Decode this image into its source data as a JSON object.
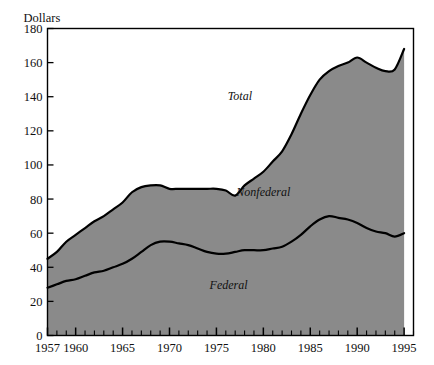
{
  "chart_data": {
    "type": "area",
    "title": "",
    "subtitle": "",
    "xlabel": "",
    "ylabel": "Dollars",
    "unit_label": "Dollars",
    "grid": false,
    "legend_position": "inline-annotations",
    "stacked": true,
    "xlim": [
      1957,
      1996
    ],
    "ylim": [
      0,
      180
    ],
    "ytick_labels": [
      "0",
      "20",
      "40",
      "60",
      "80",
      "100",
      "120",
      "140",
      "160",
      "180"
    ],
    "yticks": [
      0,
      20,
      40,
      60,
      80,
      100,
      120,
      140,
      160,
      180
    ],
    "xtick_labels": [
      "1957",
      "1960",
      "1965",
      "1970",
      "1975",
      "1980",
      "1985",
      "1990",
      "1995"
    ],
    "xticks": [
      1957,
      1960,
      1965,
      1970,
      1975,
      1980,
      1985,
      1990,
      1995
    ],
    "x": [
      1957,
      1958,
      1959,
      1960,
      1961,
      1962,
      1963,
      1964,
      1965,
      1966,
      1967,
      1968,
      1969,
      1970,
      1971,
      1972,
      1973,
      1974,
      1975,
      1976,
      1977,
      1978,
      1979,
      1980,
      1981,
      1982,
      1983,
      1984,
      1985,
      1986,
      1987,
      1988,
      1989,
      1990,
      1991,
      1992,
      1993,
      1994,
      1995
    ],
    "annotations": [
      {
        "text": "Total",
        "x": 1977.5,
        "y": 138
      },
      {
        "text": "Nonfederal",
        "x": 1980.0,
        "y": 82
      },
      {
        "text": "Federal",
        "x": 1976.3,
        "y": 27
      }
    ],
    "series": [
      {
        "name": "Federal",
        "color": "#8a8a8a",
        "line_color": "#000000",
        "values": [
          28,
          30,
          32,
          33,
          35,
          37,
          38,
          40,
          42,
          45,
          49,
          53,
          55,
          55,
          54,
          53,
          51,
          49,
          48,
          48,
          49,
          50,
          50,
          50,
          51,
          52,
          55,
          59,
          64,
          68,
          70,
          69,
          68,
          66,
          63,
          61,
          60,
          58,
          60
        ]
      },
      {
        "name": "Nonfederal",
        "color": "#8a8a8a",
        "line_color": "#000000",
        "values": [
          17,
          19,
          23,
          26,
          28,
          30,
          32,
          34,
          36,
          39,
          38,
          35,
          33,
          31,
          32,
          33,
          35,
          37,
          38,
          37,
          33,
          38,
          42,
          46,
          51,
          56,
          63,
          71,
          77,
          82,
          85,
          89,
          92,
          97,
          97,
          96,
          95,
          98,
          108
        ]
      }
    ],
    "totals": {
      "name": "Total",
      "values": [
        45,
        49,
        55,
        59,
        63,
        67,
        70,
        74,
        78,
        84,
        87,
        88,
        88,
        86,
        86,
        86,
        86,
        86,
        86,
        85,
        82,
        88,
        92,
        96,
        102,
        108,
        118,
        130,
        141,
        150,
        155,
        158,
        160,
        163,
        160,
        157,
        155,
        156,
        168
      ]
    },
    "colors": {
      "fill": "#8a8a8a",
      "line": "#000000",
      "frame": "#000000",
      "background": "#ffffff"
    }
  }
}
